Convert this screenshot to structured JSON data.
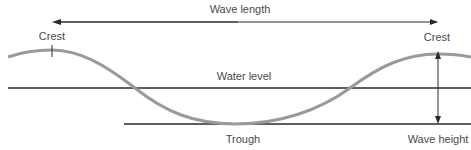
{
  "diagram": {
    "labels": {
      "wave_length": "Wave length",
      "crest_left": "Crest",
      "crest_right": "Crest",
      "water_level": "Water level",
      "trough": "Trough",
      "wave_height": "Wave height"
    },
    "colors": {
      "wave": "#9a9a9a",
      "lines": "#2a2a2a",
      "text": "#4a4a4a"
    }
  }
}
